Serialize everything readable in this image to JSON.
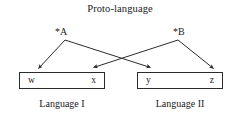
{
  "title": "Proto-language",
  "proto_forms": [
    {
      "label": "*A"
    },
    {
      "label": "*B"
    }
  ],
  "languages": [
    {
      "caption": "Language I",
      "reflexes": [
        {
          "label": "w"
        },
        {
          "label": "x"
        }
      ]
    },
    {
      "caption": "Language II",
      "reflexes": [
        {
          "label": "y"
        },
        {
          "label": "z"
        }
      ]
    }
  ],
  "colors": {
    "stroke": "#2b2b2b",
    "text": "#1a1a1a",
    "background": "#ffffff"
  }
}
